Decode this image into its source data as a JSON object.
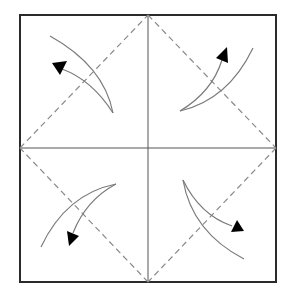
{
  "diagram": {
    "type": "origami-fold-instructions",
    "colors": {
      "background": "#ffffff",
      "border": "#2a2a2a",
      "crease": "#555555",
      "dashed_fold": "#8a8a8a",
      "arrow_line": "#7a7a7a",
      "arrowhead": "#000000"
    },
    "square": {
      "x1": 20,
      "y1": 15,
      "x2": 276,
      "y2": 282
    },
    "center": {
      "x": 148,
      "y": 148
    },
    "fold_lines": [
      {
        "name": "fold-top-left",
        "from": [
          20,
          148
        ],
        "to": [
          148,
          15
        ]
      },
      {
        "name": "fold-top-right",
        "from": [
          148,
          15
        ],
        "to": [
          276,
          148
        ]
      },
      {
        "name": "fold-bottom-right",
        "from": [
          276,
          148
        ],
        "to": [
          148,
          282
        ]
      },
      {
        "name": "fold-bottom-left",
        "from": [
          148,
          282
        ],
        "to": [
          20,
          148
        ]
      }
    ],
    "arrows": [
      {
        "corner": "top-left",
        "direction": "fold corner toward center"
      },
      {
        "corner": "top-right",
        "direction": "fold corner toward center"
      },
      {
        "corner": "bottom-left",
        "direction": "fold corner toward center"
      },
      {
        "corner": "bottom-right",
        "direction": "fold corner toward center"
      }
    ]
  }
}
